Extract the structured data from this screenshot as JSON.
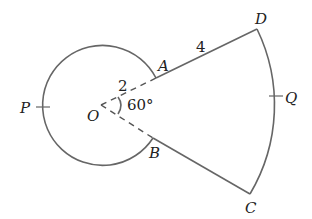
{
  "diagram": {
    "type": "geometry",
    "points": {
      "P": "P",
      "O": "O",
      "A": "A",
      "B": "B",
      "C": "C",
      "D": "D",
      "Q": "Q"
    },
    "measurements": {
      "OA": "2",
      "AD": "4",
      "angle_AOB": "60°"
    },
    "colors": {
      "stroke": "#666666",
      "text": "#222222",
      "background": "#ffffff"
    }
  }
}
